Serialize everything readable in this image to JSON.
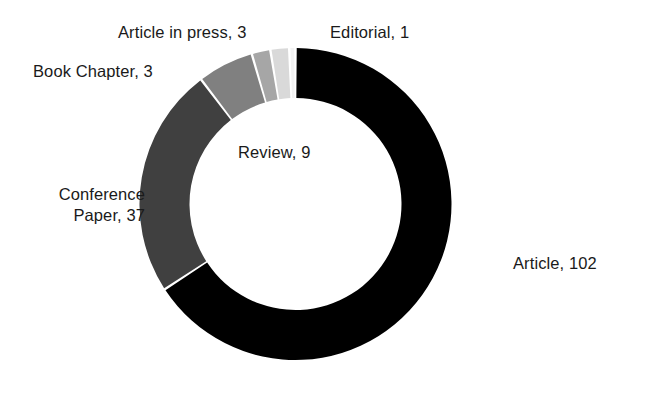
{
  "chart_data": {
    "type": "pie",
    "variant": "donut",
    "title": "",
    "xlabel": "",
    "ylabel": "",
    "legend": "none",
    "grid": false,
    "total": 155,
    "start_angle_deg": 0,
    "direction": "clockwise",
    "inner_radius_ratio": 0.62,
    "categories": [
      "Article",
      "Conference Paper",
      "Review",
      "Book Chapter",
      "Article in press",
      "Editorial"
    ],
    "values": [
      102,
      37,
      9,
      3,
      3,
      1
    ],
    "colors": [
      "#000000",
      "#404040",
      "#808080",
      "#a6a6a6",
      "#d9d9d9",
      "#f2f2f2"
    ],
    "slices": [
      {
        "name": "Article",
        "value": 102,
        "label": "Article, 102",
        "color": "#000000",
        "percent": 65.8
      },
      {
        "name": "Conference Paper",
        "value": 37,
        "label": "Conference Paper, 37",
        "color": "#404040",
        "percent": 23.9
      },
      {
        "name": "Review",
        "value": 9,
        "label": "Review, 9",
        "color": "#808080",
        "percent": 5.8
      },
      {
        "name": "Book Chapter",
        "value": 3,
        "label": "Book Chapter, 3",
        "color": "#a6a6a6",
        "percent": 1.9
      },
      {
        "name": "Article in press",
        "value": 3,
        "label": "Article in press, 3",
        "color": "#d9d9d9",
        "percent": 1.9
      },
      {
        "name": "Editorial",
        "value": 1,
        "label": "Editorial, 1",
        "color": "#f2f2f2",
        "percent": 0.6
      }
    ]
  },
  "labels": {
    "article": "Article, 102",
    "conference_paper_line1": "Conference",
    "conference_paper_line2": "Paper, 37",
    "review": "Review, 9",
    "book_chapter": "Book Chapter, 3",
    "article_in_press": "Article in press, 3",
    "editorial": "Editorial, 1"
  },
  "style": {
    "background": "#ffffff",
    "text_color": "#1a1a1a"
  }
}
